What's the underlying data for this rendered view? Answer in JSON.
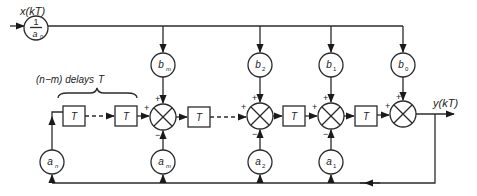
{
  "diagram": {
    "type": "block-diagram",
    "input": {
      "label": "x(kT)"
    },
    "output": {
      "label": "y(kT)"
    },
    "input_gain": {
      "numerator": "1",
      "denominator": "a",
      "denominator_sub": "0"
    },
    "delay_group_label": "(n−m) delays",
    "delay_group_symbol": "T",
    "delay_label": "T",
    "feedforward_gains": [
      {
        "base": "b",
        "sub": "m"
      },
      {
        "base": "b",
        "sub": "2"
      },
      {
        "base": "b",
        "sub": "1"
      },
      {
        "base": "b",
        "sub": "0"
      }
    ],
    "feedback_gains": [
      {
        "base": "a",
        "sub": "n"
      },
      {
        "base": "a",
        "sub": "m"
      },
      {
        "base": "a",
        "sub": "2"
      },
      {
        "base": "a",
        "sub": "1"
      }
    ],
    "signs": {
      "plus": "+",
      "minus": "−"
    }
  }
}
